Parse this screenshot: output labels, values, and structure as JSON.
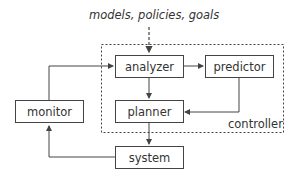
{
  "diagram": {
    "inputs_label": "models, policies, goals",
    "container_label": "controller",
    "nodes": {
      "analyzer": "analyzer",
      "predictor": "predictor",
      "planner": "planner",
      "monitor": "monitor",
      "system": "system"
    },
    "edges": [
      {
        "from": "models, policies, goals",
        "to": "analyzer",
        "style": "dashed"
      },
      {
        "from": "analyzer",
        "to": "predictor"
      },
      {
        "from": "analyzer",
        "to": "planner"
      },
      {
        "from": "predictor",
        "to": "planner"
      },
      {
        "from": "planner",
        "to": "system"
      },
      {
        "from": "system",
        "to": "monitor"
      },
      {
        "from": "monitor",
        "to": "analyzer"
      }
    ],
    "colors": {
      "stroke": "#444444",
      "text": "#333333",
      "background": "#ffffff"
    }
  }
}
